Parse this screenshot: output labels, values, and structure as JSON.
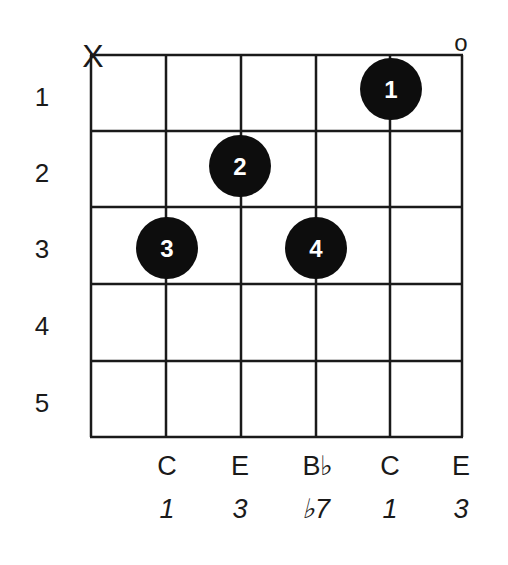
{
  "diagram": {
    "type": "guitar-chord-chart",
    "strings": 6,
    "frets": 5,
    "grid": {
      "string_x": [
        91,
        166,
        241,
        316,
        390,
        462
      ],
      "fret_y": [
        55,
        131,
        207,
        284,
        361,
        437
      ],
      "line_color": "#1a1a1a"
    },
    "fret_numbers": [
      "1",
      "2",
      "3",
      "4",
      "5"
    ],
    "open_muted_markers": [
      {
        "string": 1,
        "symbol": "X",
        "meaning": "muted"
      },
      {
        "string": 6,
        "symbol": "o",
        "meaning": "open"
      }
    ],
    "fingers": [
      {
        "finger": "1",
        "string": 5,
        "fret": 1
      },
      {
        "finger": "2",
        "string": 3,
        "fret": 2
      },
      {
        "finger": "3",
        "string": 2,
        "fret": 3
      },
      {
        "finger": "4",
        "string": 4,
        "fret": 3
      }
    ],
    "notes": [
      {
        "string": 2,
        "note": "C",
        "interval": "1"
      },
      {
        "string": 3,
        "note": "E",
        "interval": "3"
      },
      {
        "string": 4,
        "note": "B♭",
        "interval": "♭7"
      },
      {
        "string": 5,
        "note": "C",
        "interval": "1"
      },
      {
        "string": 6,
        "note": "E",
        "interval": "3"
      }
    ],
    "dot_color": "#0d0d0d",
    "dot_text_color": "#ffffff"
  }
}
